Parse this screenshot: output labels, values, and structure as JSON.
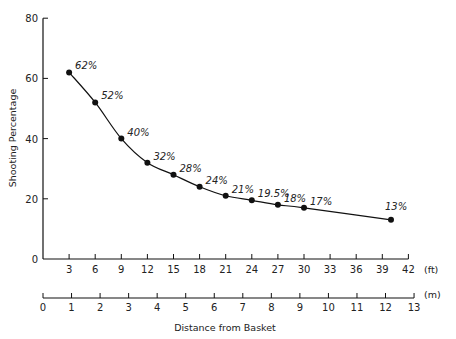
{
  "chart_data": {
    "type": "line",
    "title": "",
    "xlabel": "Distance from Basket",
    "ylabel": "Shooting Percentage",
    "x_unit_primary": "(ft)",
    "x_unit_secondary": "(m)",
    "xlim": [
      0,
      42
    ],
    "ylim": [
      0,
      80
    ],
    "y_ticks": [
      0,
      20,
      40,
      60,
      80
    ],
    "x_ticks_ft": [
      3,
      6,
      9,
      12,
      15,
      18,
      21,
      24,
      27,
      30,
      33,
      36,
      39,
      42
    ],
    "x_ticks_m": [
      0,
      1,
      2,
      3,
      4,
      5,
      6,
      7,
      8,
      9,
      10,
      11,
      12,
      13
    ],
    "grid": false,
    "legend": null,
    "series": [
      {
        "name": "Shooting Percentage",
        "x": [
          3,
          6,
          9,
          12,
          15,
          18,
          21,
          24,
          27,
          30,
          40
        ],
        "values": [
          62,
          52,
          40,
          32,
          28,
          24,
          21,
          19.5,
          18,
          17,
          13
        ],
        "point_labels": [
          "62%",
          "52%",
          "40%",
          "32%",
          "28%",
          "24%",
          "21%",
          "19.5%",
          "18%",
          "17%",
          "13%"
        ]
      }
    ]
  }
}
